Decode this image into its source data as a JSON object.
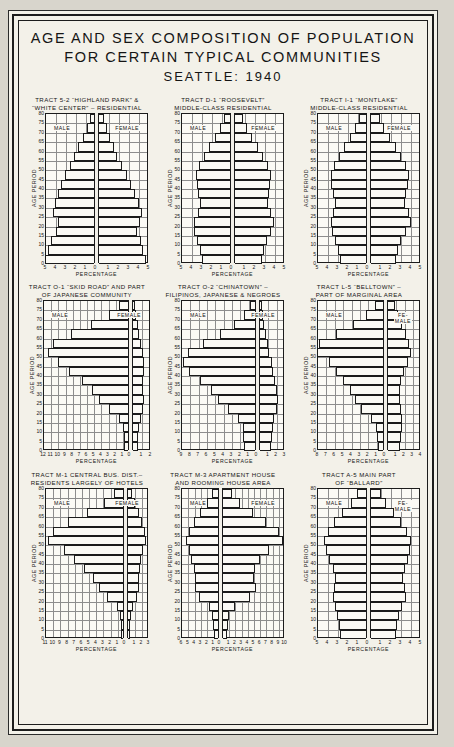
{
  "title": {
    "line1": "AGE AND SEX COMPOSITION OF POPULATION",
    "line2": "FOR CERTAIN TYPICAL COMMUNITIES",
    "line3": "SEATTLE: 1940"
  },
  "common": {
    "ylabel": "AGE PERIOD",
    "xlabel": "PERCENTAGE",
    "male_label": "MALE",
    "female_label": "FEMALE",
    "female_label_two_line": "FE-\nMALE",
    "age_ticks": [
      0,
      5,
      10,
      15,
      20,
      25,
      30,
      35,
      40,
      45,
      50,
      55,
      60,
      65,
      70,
      75,
      80
    ]
  },
  "chart_data": [
    {
      "type": "bar",
      "id": "tract-5-2-highland-park",
      "title_line1": "TRACT 5-2 “HIGHLAND PARK” &",
      "title_line2": "“WHITE CENTER” – RESIDENTIAL",
      "xlabel": "PERCENTAGE",
      "ylabel": "AGE PERIOD",
      "xlim_left": 5,
      "xlim_right": 5,
      "xticks_left": [
        5,
        4,
        3,
        2,
        1,
        0
      ],
      "xticks_right": [
        1,
        2,
        3,
        4,
        5
      ],
      "categories": [
        "0-4",
        "5-9",
        "10-14",
        "15-19",
        "20-24",
        "25-29",
        "30-34",
        "35-39",
        "40-44",
        "45-49",
        "50-54",
        "55-59",
        "60-64",
        "65-69",
        "70-74",
        "75-79"
      ],
      "series": [
        {
          "name": "MALE",
          "values": [
            4.9,
            4.6,
            4.3,
            3.8,
            3.6,
            4.1,
            3.9,
            3.6,
            3.3,
            2.9,
            2.4,
            2.0,
            1.6,
            1.1,
            0.7,
            0.4
          ]
        },
        {
          "name": "FEMALE",
          "values": [
            4.7,
            4.4,
            4.2,
            3.8,
            4.1,
            4.3,
            4.0,
            3.6,
            3.2,
            2.8,
            2.3,
            1.8,
            1.5,
            1.1,
            0.8,
            0.5
          ]
        }
      ]
    },
    {
      "type": "bar",
      "id": "tract-d-1-roosevelt",
      "title_line1": "TRACT D-1 “ROOSEVELT”",
      "title_line2": "MIDDLE-CLASS RESIDENTIAL",
      "xlabel": "PERCENTAGE",
      "ylabel": "AGE PERIOD",
      "xlim_left": 5,
      "xlim_right": 5,
      "xticks_left": [
        5,
        4,
        3,
        2,
        1,
        0
      ],
      "xticks_right": [
        1,
        2,
        3,
        4,
        5
      ],
      "categories": [
        "0-4",
        "5-9",
        "10-14",
        "15-19",
        "20-24",
        "25-29",
        "30-34",
        "35-39",
        "40-44",
        "45-49",
        "50-54",
        "55-59",
        "60-64",
        "65-69",
        "70-74",
        "75-79"
      ],
      "series": [
        {
          "name": "MALE",
          "values": [
            2.8,
            3.0,
            3.3,
            3.6,
            3.6,
            3.2,
            3.0,
            3.2,
            3.3,
            3.4,
            3.1,
            2.6,
            2.1,
            1.5,
            1.0,
            0.6
          ]
        },
        {
          "name": "FEMALE",
          "values": [
            2.7,
            2.9,
            3.2,
            3.6,
            3.9,
            3.6,
            3.3,
            3.4,
            3.5,
            3.6,
            3.3,
            2.8,
            2.3,
            1.7,
            1.2,
            0.8
          ]
        }
      ]
    },
    {
      "type": "bar",
      "id": "tract-l-1-montlake",
      "title_line1": "TRACT I-1 “MONTLAKE”",
      "title_line2": "MIDDLE-CLASS RESIDENTIAL",
      "xlabel": "PERCENTAGE",
      "ylabel": "AGE PERIOD",
      "xlim_left": 5,
      "xlim_right": 5,
      "xticks_left": [
        5,
        4,
        3,
        2,
        1,
        0
      ],
      "xticks_right": [
        1,
        2,
        3,
        4,
        5
      ],
      "categories": [
        "0-4",
        "5-9",
        "10-14",
        "15-19",
        "20-24",
        "25-29",
        "30-34",
        "35-39",
        "40-44",
        "45-49",
        "50-54",
        "55-59",
        "60-64",
        "65-69",
        "70-74",
        "75-79"
      ],
      "series": [
        {
          "name": "MALE",
          "values": [
            2.6,
            2.8,
            3.1,
            3.4,
            3.5,
            3.3,
            3.1,
            3.3,
            3.5,
            3.5,
            3.2,
            2.7,
            2.2,
            1.6,
            1.1,
            0.7
          ]
        },
        {
          "name": "FEMALE",
          "values": [
            2.5,
            2.7,
            3.0,
            3.5,
            4.0,
            3.8,
            3.4,
            3.5,
            3.7,
            3.8,
            3.5,
            3.0,
            2.5,
            1.9,
            1.3,
            0.9
          ]
        }
      ]
    },
    {
      "type": "bar",
      "id": "tract-o-1-skid-road",
      "title_line1": "TRACT O-1 “SKID ROAD” AND PART",
      "title_line2": "OF JAPANESE COMMUNITY",
      "xlabel": "PERCENTAGE",
      "ylabel": "AGE PERIOD",
      "xlim_left": 12,
      "xlim_right": 2,
      "xticks_left": [
        12,
        11,
        10,
        9,
        8,
        7,
        6,
        5,
        4,
        3,
        2,
        1,
        0
      ],
      "xticks_right": [
        1,
        2
      ],
      "categories": [
        "0-4",
        "5-9",
        "10-14",
        "15-19",
        "20-24",
        "25-29",
        "30-34",
        "35-39",
        "40-44",
        "45-49",
        "50-54",
        "55-59",
        "60-64",
        "65-69",
        "70-74",
        "75-79"
      ],
      "series": [
        {
          "name": "MALE",
          "values": [
            0.5,
            0.6,
            0.7,
            1.3,
            2.6,
            4.0,
            5.0,
            6.4,
            8.2,
            9.8,
            11.2,
            10.4,
            8.0,
            5.2,
            2.6,
            1.2
          ]
        },
        {
          "name": "FEMALE",
          "values": [
            0.5,
            0.6,
            0.7,
            0.9,
            1.1,
            1.2,
            1.1,
            1.1,
            1.2,
            1.2,
            1.1,
            0.9,
            0.7,
            0.5,
            0.3,
            0.2
          ]
        }
      ]
    },
    {
      "type": "bar",
      "id": "tract-o-2-chinatown",
      "title_line1": "TRACT O-2 “CHINATOWN” –",
      "title_line2": "FILIPINOS, JAPANESE & NEGROES",
      "xlabel": "PERCENTAGE",
      "ylabel": "AGE PERIOD",
      "xlim_left": 9,
      "xlim_right": 3,
      "xticks_left": [
        9,
        8,
        7,
        6,
        5,
        4,
        3,
        2,
        1,
        0
      ],
      "xticks_right": [
        1,
        2,
        3
      ],
      "categories": [
        "0-4",
        "5-9",
        "10-14",
        "15-19",
        "20-24",
        "25-29",
        "30-34",
        "35-39",
        "40-44",
        "45-49",
        "50-54",
        "55-59",
        "60-64",
        "65-69",
        "70-74",
        "75-79"
      ],
      "series": [
        {
          "name": "MALE",
          "values": [
            1.3,
            1.4,
            1.5,
            2.0,
            3.2,
            4.4,
            5.3,
            6.6,
            7.9,
            8.6,
            8.0,
            6.2,
            4.2,
            2.5,
            1.3,
            0.6
          ]
        },
        {
          "name": "FEMALE",
          "values": [
            1.3,
            1.4,
            1.5,
            1.7,
            2.0,
            2.2,
            2.0,
            1.8,
            1.6,
            1.4,
            1.1,
            0.9,
            0.7,
            0.5,
            0.3,
            0.2
          ]
        }
      ]
    },
    {
      "type": "bar",
      "id": "tract-l-5-belltown",
      "title_line1": "TRACT L-5 “BELLTOWN” –",
      "title_line2": "PART OF MARGINAL AREA",
      "xlabel": "PERCENTAGE",
      "ylabel": "AGE PERIOD",
      "xlim_left": 8,
      "xlim_right": 4,
      "xticks_left": [
        8,
        7,
        6,
        5,
        4,
        3,
        2,
        1,
        0
      ],
      "xticks_right": [
        1,
        2,
        3,
        4
      ],
      "categories": [
        "0-4",
        "5-9",
        "10-14",
        "15-19",
        "20-24",
        "25-29",
        "30-34",
        "35-39",
        "40-44",
        "45-49",
        "50-54",
        "55-59",
        "60-64",
        "65-69",
        "70-74",
        "75-79"
      ],
      "series": [
        {
          "name": "MALE",
          "values": [
            0.6,
            0.7,
            0.8,
            1.4,
            2.6,
            3.4,
            4.0,
            4.8,
            5.6,
            6.4,
            7.9,
            7.6,
            5.6,
            3.6,
            2.0,
            1.0
          ]
        },
        {
          "name": "FEMALE",
          "values": [
            1.5,
            1.6,
            1.7,
            1.7,
            1.6,
            1.5,
            1.5,
            1.6,
            1.9,
            2.4,
            2.8,
            2.6,
            2.2,
            1.7,
            1.2,
            0.8
          ]
        }
      ]
    },
    {
      "type": "bar",
      "id": "tract-m-1-central-business",
      "title_line1": "TRACT M-1 CENTRAL BUS. DIST.–",
      "title_line2": "RESIDENTS LARGELY OF HOTELS",
      "xlabel": "PERCENTAGE",
      "ylabel": "AGE PERIOD",
      "xlim_left": 11,
      "xlim_right": 3,
      "xticks_left": [
        11,
        10,
        9,
        8,
        7,
        6,
        5,
        4,
        3,
        2,
        1,
        0
      ],
      "xticks_right": [
        1,
        2,
        3
      ],
      "categories": [
        "0-4",
        "5-9",
        "10-14",
        "15-19",
        "20-24",
        "25-29",
        "30-34",
        "35-39",
        "40-44",
        "45-49",
        "50-54",
        "55-59",
        "60-64",
        "65-69",
        "70-74",
        "75-79"
      ],
      "series": [
        {
          "name": "MALE",
          "values": [
            0.3,
            0.3,
            0.4,
            0.9,
            2.2,
            3.4,
            4.2,
            5.4,
            6.8,
            8.2,
            10.4,
            9.8,
            7.6,
            5.0,
            2.6,
            1.2
          ]
        },
        {
          "name": "FEMALE",
          "values": [
            0.3,
            0.3,
            0.4,
            0.7,
            1.3,
            1.6,
            1.6,
            1.7,
            1.9,
            2.2,
            2.6,
            2.4,
            2.0,
            1.5,
            1.0,
            0.6
          ]
        }
      ]
    },
    {
      "type": "bar",
      "id": "tract-m-3-apartment-house",
      "title_line1": "TRACT M-3 APARTMENT HOUSE",
      "title_line2": "AND ROOMING HOUSE AREA",
      "xlabel": "PERCENTAGE",
      "ylabel": "AGE PERIOD",
      "xlim_left": 6,
      "xlim_right": 10,
      "xticks_left": [
        6,
        5,
        4,
        3,
        2,
        1,
        0
      ],
      "xticks_right": [
        1,
        2,
        3,
        4,
        5,
        6,
        7,
        8,
        9,
        10
      ],
      "categories": [
        "0-4",
        "5-9",
        "10-14",
        "15-19",
        "20-24",
        "25-29",
        "30-34",
        "35-39",
        "40-44",
        "45-49",
        "50-54",
        "55-59",
        "60-64",
        "65-69",
        "70-74",
        "75-79"
      ],
      "series": [
        {
          "name": "MALE",
          "values": [
            0.7,
            0.8,
            0.9,
            1.5,
            3.0,
            3.6,
            3.6,
            3.8,
            4.2,
            4.6,
            5.0,
            4.6,
            3.8,
            2.8,
            1.7,
            0.9
          ]
        },
        {
          "name": "FEMALE",
          "values": [
            0.7,
            0.8,
            0.9,
            2.0,
            4.4,
            5.4,
            5.0,
            5.2,
            6.0,
            7.4,
            9.6,
            9.0,
            7.0,
            4.8,
            2.8,
            1.4
          ]
        }
      ]
    },
    {
      "type": "bar",
      "id": "tract-a-5-ballard",
      "title_line1": "TRACT A-5 MAIN PART",
      "title_line2": "OF “BALLARD”",
      "xlabel": "PERCENTAGE",
      "ylabel": "AGE PERIOD",
      "xlim_left": 5,
      "xlim_right": 5,
      "xticks_left": [
        5,
        4,
        3,
        2,
        1,
        0
      ],
      "xticks_right": [
        1,
        2,
        3,
        4,
        5
      ],
      "categories": [
        "0-4",
        "5-9",
        "10-14",
        "15-19",
        "20-24",
        "25-29",
        "30-34",
        "35-39",
        "40-44",
        "45-49",
        "50-54",
        "55-59",
        "60-64",
        "65-69",
        "70-74",
        "75-79"
      ],
      "series": [
        {
          "name": "MALE",
          "values": [
            2.6,
            2.7,
            2.9,
            3.1,
            3.3,
            3.2,
            3.1,
            3.3,
            3.7,
            4.0,
            4.2,
            3.8,
            3.2,
            2.4,
            1.5,
            0.9
          ]
        },
        {
          "name": "FEMALE",
          "values": [
            2.5,
            2.6,
            2.8,
            3.1,
            3.5,
            3.4,
            3.2,
            3.4,
            3.7,
            3.9,
            4.0,
            3.6,
            3.0,
            2.3,
            1.5,
            1.0
          ]
        }
      ]
    }
  ]
}
